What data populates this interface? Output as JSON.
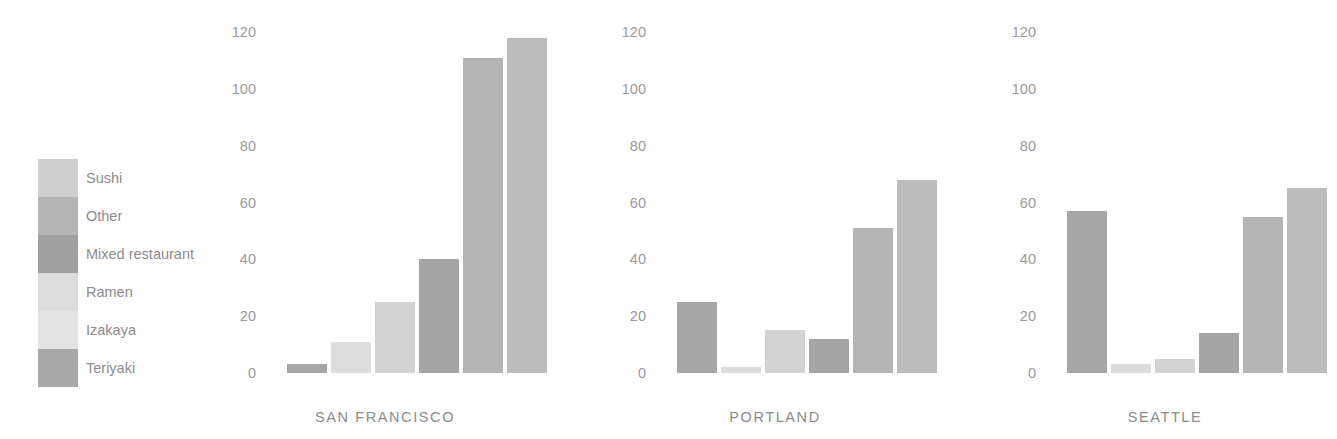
{
  "chart_data": {
    "type": "bar",
    "title": "",
    "subtitle": "",
    "xlabel": "",
    "ylabel": "",
    "ylim": [
      0,
      120
    ],
    "yticks": [
      0,
      20,
      40,
      60,
      80,
      100,
      120
    ],
    "ytick_labels": [
      "0",
      "20",
      "40",
      "60",
      "80",
      "100",
      "120"
    ],
    "grid": false,
    "legend_position": "left",
    "categories": [
      "Sushi",
      "Other",
      "Mixed restaurant",
      "Ramen",
      "Izakaya",
      "Teriyaki"
    ],
    "category_colors": [
      "#cfcfcf",
      "#b4b4b4",
      "#a0a0a0",
      "#dcdcdc",
      "#e3e3e3",
      "#a8a8a8"
    ],
    "panels": [
      {
        "name": "SAN FRANCISCO",
        "values": [
          3,
          11,
          25,
          40,
          111,
          118
        ],
        "bar_colors": [
          "#a6a6a6",
          "#dcdcdc",
          "#d2d2d2",
          "#a5a5a5",
          "#b4b4b4",
          "#bcbcbc"
        ]
      },
      {
        "name": "PORTLAND",
        "values": [
          25,
          2,
          15,
          12,
          51,
          68
        ],
        "bar_colors": [
          "#a6a6a6",
          "#dcdcdc",
          "#d2d2d2",
          "#a5a5a5",
          "#b4b4b4",
          "#bcbcbc"
        ]
      },
      {
        "name": "SEATTLE",
        "values": [
          57,
          3,
          5,
          14,
          55,
          65
        ],
        "bar_colors": [
          "#a6a6a6",
          "#dcdcdc",
          "#d2d2d2",
          "#a5a5a5",
          "#b4b4b4",
          "#bcbcbc"
        ]
      }
    ]
  },
  "legend": {
    "items": [
      {
        "label": "Sushi",
        "color": "#cfcfcf"
      },
      {
        "label": "Other",
        "color": "#b4b4b4"
      },
      {
        "label": "Mixed restaurant",
        "color": "#a0a0a0"
      },
      {
        "label": "Ramen",
        "color": "#dcdcdc"
      },
      {
        "label": "Izakaya",
        "color": "#e3e3e3"
      },
      {
        "label": "Teriyaki",
        "color": "#a8a8a8"
      }
    ]
  }
}
